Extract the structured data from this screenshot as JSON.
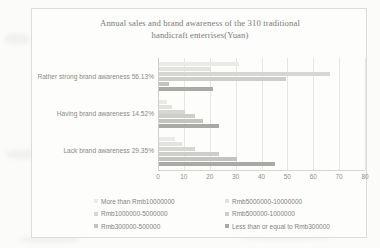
{
  "chart_data": {
    "type": "bar",
    "orientation": "horizontal",
    "title": "Annual sales and brand awareness of the 310 traditional handicraft enterrises(Yuan)",
    "title_line1": "Annual sales and brand awareness of the 310 traditional",
    "title_line2": "handicraft enterrises(Yuan)",
    "xlabel": "",
    "ylabel": "",
    "xlim": [
      0,
      80
    ],
    "xticks": [
      "0",
      "10",
      "20",
      "30",
      "40",
      "50",
      "60",
      "70",
      "80"
    ],
    "grid": true,
    "legend_position": "bottom",
    "categories": [
      "Rather strong brand awareness 56.13%",
      "Having brand awareness 14.52%",
      "Lack brand awareness  29.35%"
    ],
    "series": [
      {
        "name": "More than Rmb10000000",
        "color": "#eaeae7",
        "values": [
          31,
          3,
          6
        ]
      },
      {
        "name": "Rmb5000000-10000000",
        "color": "#e2e2de",
        "values": [
          20,
          5,
          9
        ]
      },
      {
        "name": "Rmb1000000-5000000",
        "color": "#d6d6d2",
        "values": [
          66,
          10,
          14
        ]
      },
      {
        "name": "Rmb500000-1000000",
        "color": "#cdcdc9",
        "values": [
          49,
          14,
          23
        ]
      },
      {
        "name": "Rmb300000-500000",
        "color": "#c3c3bf",
        "values": [
          4,
          17,
          30
        ]
      },
      {
        "name": "Less than or equal to Rmb300000",
        "color": "#a9a9a5",
        "values": [
          21,
          23,
          45
        ]
      }
    ]
  },
  "legend": {
    "items": [
      "More than Rmb10000000",
      "Rmb5000000-10000000",
      "Rmb1000000-5000000",
      "Rmb500000-1000000",
      "Rmb300000-500000",
      "Less than or equal to Rmb300000"
    ]
  }
}
